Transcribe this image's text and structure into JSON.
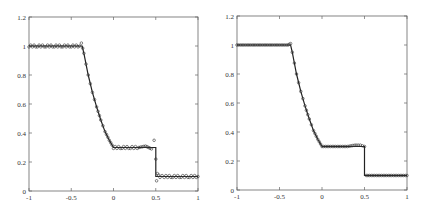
{
  "chart_data": [
    {
      "type": "line",
      "title": "",
      "xlabel": "",
      "ylabel": "",
      "xlim": [
        -1,
        1
      ],
      "ylim": [
        0,
        1.2
      ],
      "grid": false,
      "xticks": [
        "-1",
        "-0.5",
        "0",
        "0.5",
        "1"
      ],
      "yticks": [
        "0",
        "0.2",
        "0.4",
        "0.6",
        "0.8",
        "1",
        "1.2"
      ],
      "series": [
        {
          "name": "exact",
          "style": "solid line",
          "x": [
            -1,
            -0.37,
            -0.35,
            -0.3,
            -0.25,
            -0.2,
            -0.15,
            -0.1,
            -0.05,
            0,
            0.5,
            0.5,
            1
          ],
          "y": [
            1.0,
            1.0,
            0.95,
            0.8,
            0.68,
            0.58,
            0.49,
            0.41,
            0.35,
            0.3,
            0.3,
            0.1,
            0.1
          ]
        },
        {
          "name": "numerical",
          "style": "markers",
          "notes": "small oscillations near 1.0 plateau and 0.3 plateau; overshoot to ~0.35 and undershoot to ~0.07 around x=0.5",
          "x": [
            -1,
            -0.9,
            -0.8,
            -0.7,
            -0.6,
            -0.5,
            -0.4,
            -0.38,
            -0.35,
            -0.3,
            -0.25,
            -0.2,
            -0.15,
            -0.1,
            -0.05,
            0,
            0.1,
            0.2,
            0.3,
            0.38,
            0.45,
            0.48,
            0.5,
            0.51,
            0.52,
            0.55,
            0.6,
            0.7,
            0.8,
            0.9,
            1
          ],
          "y": [
            1.0,
            1.0,
            1.0,
            1.0,
            1.0,
            1.0,
            1.0,
            1.02,
            0.95,
            0.8,
            0.68,
            0.58,
            0.49,
            0.41,
            0.35,
            0.3,
            0.3,
            0.3,
            0.3,
            0.31,
            0.29,
            0.35,
            0.22,
            0.07,
            0.12,
            0.1,
            0.1,
            0.1,
            0.1,
            0.1,
            0.1
          ]
        }
      ]
    },
    {
      "type": "line",
      "title": "",
      "xlabel": "",
      "ylabel": "",
      "xlim": [
        -1,
        1
      ],
      "ylim": [
        0,
        1.2
      ],
      "grid": false,
      "xticks": [
        "-1",
        "-0.5",
        "0",
        "0.5",
        "1"
      ],
      "yticks": [
        "0",
        "0.2",
        "0.4",
        "0.6",
        "0.8",
        "1",
        "1.2"
      ],
      "series": [
        {
          "name": "exact",
          "style": "solid line",
          "x": [
            -1,
            -0.37,
            -0.35,
            -0.3,
            -0.25,
            -0.2,
            -0.15,
            -0.1,
            -0.05,
            0,
            0.5,
            0.5,
            1
          ],
          "y": [
            1.0,
            1.0,
            0.95,
            0.8,
            0.68,
            0.58,
            0.49,
            0.41,
            0.35,
            0.3,
            0.3,
            0.1,
            0.1
          ]
        },
        {
          "name": "numerical",
          "style": "markers",
          "notes": "dense markers, minimal oscillation, sharp discontinuity at x=0.5",
          "x": [
            -1,
            -0.9,
            -0.8,
            -0.7,
            -0.6,
            -0.5,
            -0.4,
            -0.37,
            -0.35,
            -0.3,
            -0.25,
            -0.2,
            -0.15,
            -0.1,
            -0.05,
            0,
            0.1,
            0.2,
            0.3,
            0.4,
            0.45,
            0.5,
            0.52,
            0.6,
            0.7,
            0.8,
            0.9,
            1
          ],
          "y": [
            1.0,
            1.0,
            1.0,
            1.0,
            1.0,
            1.0,
            1.0,
            1.01,
            0.95,
            0.8,
            0.68,
            0.58,
            0.49,
            0.41,
            0.35,
            0.3,
            0.3,
            0.3,
            0.3,
            0.31,
            0.31,
            0.3,
            0.1,
            0.1,
            0.1,
            0.1,
            0.1,
            0.1
          ]
        }
      ]
    }
  ],
  "panels": [
    {
      "left": 29,
      "top": 17,
      "right": 198,
      "bottom": 191
    },
    {
      "left": 237,
      "top": 16,
      "right": 407,
      "bottom": 190
    }
  ]
}
